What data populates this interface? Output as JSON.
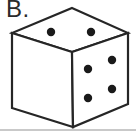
{
  "label": {
    "text": "B."
  },
  "colors": {
    "line": "#262626",
    "pip": "#1a1a1a",
    "face_fill": "#ffffff",
    "background": "#ffffff",
    "bottom_rule": "#c9c9c9",
    "label_text": "#2b2b2b"
  },
  "figure": {
    "type": "die-cube-isometric",
    "viewbox": "0 0 136 133",
    "stroke_width": 2.2,
    "pip_radius": 4.2,
    "faces": [
      {
        "name": "top",
        "points": "72,8 128,33 72,52 12,33",
        "pip_count": 2,
        "pips": [
          [
            51,
            32
          ],
          [
            91,
            32
          ]
        ]
      },
      {
        "name": "left",
        "points": "12,33 72,52 73,127 12,108",
        "pip_count": 0,
        "pips": []
      },
      {
        "name": "right",
        "points": "72,52 128,33 128,104 73,127",
        "pip_count": 4,
        "pips": [
          [
            112,
            60
          ],
          [
            88,
            69
          ],
          [
            112,
            89
          ],
          [
            88,
            98
          ]
        ]
      }
    ]
  }
}
